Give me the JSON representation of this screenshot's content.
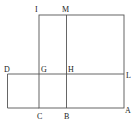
{
  "labels": {
    "I": "I",
    "M": "M",
    "D": "D",
    "G": "G",
    "H": "H",
    "L": "L",
    "C": "C",
    "B": "B",
    "A": "A"
  },
  "colors": {
    "line": "#555555",
    "text": "#222222",
    "background": "#ffffff"
  }
}
